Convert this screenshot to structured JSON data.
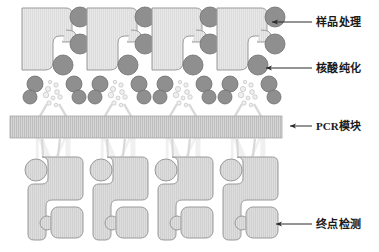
{
  "figure": {
    "background_color": "#ffffff",
    "width": 379,
    "height": 252,
    "watermark_letter": "M"
  },
  "palette": {
    "body_fill": "#e3e3e3",
    "body_fill_light": "#ebebeb",
    "body_stroke": "#9a9a9a",
    "circle_fill": "#8f8f8f",
    "circle_stroke": "#6e6e6e",
    "pcr_fill": "#cfcfcf",
    "pcr_stroke": "#a8a8a8",
    "droplet_fill": "#efefef",
    "droplet_stroke": "#b5b5b5",
    "arrow_color": "#2a2a2a",
    "text_color": "#1a1a1a",
    "watermark_color": "#e4e4e4"
  },
  "labels": [
    {
      "id": "sample-processing",
      "text": "样品处理",
      "text_x": 316,
      "text_y": 26,
      "leader_x1": 312,
      "leader_x2": 268,
      "leader_y": 22,
      "arrow_target_x": 264,
      "target": "top-right dark circle of upper cartridge"
    },
    {
      "id": "nucleic-acid-purification",
      "text": "核酸纯化",
      "text_x": 316,
      "text_y": 72,
      "leader_x1": 312,
      "leader_x2": 262,
      "leader_y": 68,
      "arrow_target_x": 258,
      "target": "large dark circle at cartridge notch"
    },
    {
      "id": "pcr-module",
      "text": "PCR模块",
      "text_x": 316,
      "text_y": 130,
      "leader_x1": 312,
      "leader_x2": 288,
      "leader_y": 126,
      "arrow_target_x": 284,
      "target": "horizontal hatched PCR bar"
    },
    {
      "id": "endpoint-detection",
      "text": "终点检测",
      "text_x": 316,
      "text_y": 228,
      "leader_x1": 312,
      "leader_x2": 272,
      "leader_y": 224,
      "arrow_target_x": 268,
      "target": "rounded detection chamber of lower cartridge"
    }
  ],
  "columns": {
    "count": 4,
    "x_offsets": [
      0,
      65,
      130,
      195
    ],
    "base_x": 22
  },
  "upper_unit": {
    "name": "sample-prep-cartridge",
    "body_path": "M0,8 L44,8 Q50,8 50,14 L50,34 Q50,40 44,40 L36,40 Q30,40 30,46 L30,66 Q30,72 24,72 L0,72 Z",
    "body_x": 0,
    "body_y": 6,
    "circles": [
      {
        "cx": 58,
        "cy": 17,
        "r": 10,
        "name": "sample-inlet-bead"
      },
      {
        "cx": 58,
        "cy": 44,
        "r": 10,
        "name": "reagent-bead"
      },
      {
        "cx": 41,
        "cy": 64,
        "r": 10,
        "name": "purification-bead"
      },
      {
        "cx": 16,
        "cy": 84,
        "r": 8,
        "name": "waste-bead-left"
      },
      {
        "cx": 52,
        "cy": 84,
        "r": 8,
        "name": "waste-bead-right"
      },
      {
        "cx": 10,
        "cy": 98,
        "r": 7,
        "name": "outlet-bead-left"
      },
      {
        "cx": 57,
        "cy": 98,
        "r": 7,
        "name": "outlet-bead-right"
      }
    ],
    "droplets": [
      {
        "cx": 30,
        "cy": 88,
        "r": 2.6
      },
      {
        "cx": 37,
        "cy": 86,
        "r": 2.2
      },
      {
        "cx": 27,
        "cy": 95,
        "r": 2.8
      },
      {
        "cx": 35,
        "cy": 94,
        "r": 2.4
      },
      {
        "cx": 31,
        "cy": 100,
        "r": 2.0
      },
      {
        "cx": 24,
        "cy": 101,
        "r": 2.2
      },
      {
        "cx": 38,
        "cy": 100,
        "r": 2.3
      },
      {
        "cx": 33,
        "cy": 105,
        "r": 1.8
      },
      {
        "cx": 28,
        "cy": 82,
        "r": 1.7
      }
    ],
    "funnel_left": "M26,104 L20,116",
    "funnel_right": "M37,104 L43,116"
  },
  "pcr_bar": {
    "name": "pcr-module-bar",
    "x": 10,
    "y": 116,
    "width": 272,
    "height": 22,
    "hatch_spacing": 2,
    "label_ref": "pcr-module"
  },
  "lower_unit": {
    "name": "detection-cartridge",
    "inlet_lines": [
      {
        "x1": 20,
        "y1": 138,
        "x2": 22,
        "y2": 155
      },
      {
        "x1": 38,
        "y1": 138,
        "x2": 36,
        "y2": 155
      }
    ],
    "body_path": "M14,158 L56,158 Q62,158 62,164 L62,196 Q62,202 56,202 L32,202 Q26,202 26,208 L26,232 Q26,238 20,238 L14,238 Q8,238 8,232 L8,164 Q8,158 14,158 Z",
    "circle": {
      "cx": 15,
      "cy": 168,
      "r": 11,
      "name": "lower-inlet-chamber"
    },
    "small_circle": {
      "cx": 27,
      "cy": 222,
      "r": 7,
      "name": "valve-node"
    },
    "detection_chamber": {
      "x": 31,
      "y": 206,
      "width": 30,
      "height": 30,
      "rx": 7,
      "name": "detection-chamber"
    }
  }
}
